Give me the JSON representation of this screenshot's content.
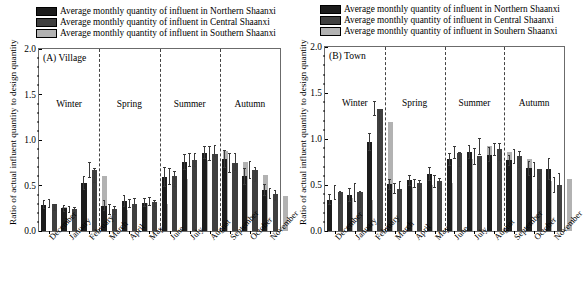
{
  "figure": {
    "panels": [
      {
        "id": "A",
        "label": "(A) Village",
        "ylabel": "Ratio of actual influent quantity to design quantity",
        "legend": [
          "Average monthly quantity of influent in Northern Shaanxi",
          "Average monthly quantity of influent in Central Shaanxi",
          "Average monthly quantity of influent in Southern Shaanxi"
        ]
      },
      {
        "id": "B",
        "label": "(B) Town",
        "ylabel": "Ratio of actual influent quantity to design quantity",
        "legend": [
          "Average monthly quantity of influent in Northern Shaanxi",
          "Average monthly quantity of influent in Central Shaanxi",
          "Average monthly quantity of influent in Souhern Shaanxi"
        ]
      }
    ],
    "colors": {
      "northern": "#1c1c1c",
      "central": "#3f3f3f",
      "southern": "#b2b2b2",
      "frame": "#6b6b6b",
      "error": "#3a3a3a"
    }
  },
  "chart_data": [
    {
      "type": "bar",
      "title": "(A) Village",
      "xlabel": "",
      "ylabel": "Ratio of actual influent quantity to design quantity",
      "ylim": [
        0.0,
        2.0
      ],
      "yticks": [
        "0.0",
        "0.5",
        "1.0",
        "1.5",
        "2.0"
      ],
      "grid": false,
      "legend_position": "top",
      "categories": [
        "December",
        "January",
        "February",
        "March",
        "April",
        "May",
        "June",
        "July",
        "August",
        "September",
        "October",
        "November"
      ],
      "season_labels": [
        "Winter",
        "Spring",
        "Summer",
        "Autumn"
      ],
      "season_breaks": [
        3,
        6,
        9
      ],
      "series": [
        {
          "name": "Average monthly quantity of influent in Northern Shaanxi",
          "color": "#1c1c1c",
          "values": [
            0.29,
            0.25,
            0.53,
            0.28,
            0.33,
            0.31,
            0.59,
            0.76,
            0.86,
            0.79,
            0.6,
            0.45
          ],
          "errors": [
            0.05,
            0.04,
            0.08,
            0.06,
            0.07,
            0.05,
            0.11,
            0.09,
            0.07,
            0.1,
            0.09,
            0.07
          ]
        },
        {
          "name": "Average monthly quantity of influent in Central Shaanxi",
          "color": "#3f3f3f",
          "values": [
            0.3,
            0.24,
            0.67,
            0.24,
            0.3,
            0.32,
            0.6,
            0.78,
            0.85,
            0.75,
            0.67,
            0.41
          ],
          "errors": [
            0.05,
            0.04,
            0.09,
            0.06,
            0.05,
            0.05,
            0.09,
            0.08,
            0.08,
            0.11,
            0.1,
            0.06
          ]
        },
        {
          "name": "Average monthly quantity of influent in Southern Shaanxi",
          "color": "#b2b2b2",
          "values": [
            0.26,
            0.22,
            0.61,
            0.23,
            0.31,
            0.3,
            0.57,
            0.78,
            0.88,
            0.76,
            0.62,
            0.39
          ],
          "errors": [
            0.04,
            0.04,
            0.08,
            0.05,
            0.05,
            0.04,
            0.09,
            0.08,
            0.07,
            0.1,
            0.08,
            0.06
          ]
        }
      ]
    },
    {
      "type": "bar",
      "title": "(B) Town",
      "xlabel": "",
      "ylabel": "Ratio of actual influent quantity to design quantity",
      "ylim": [
        0.0,
        2.0
      ],
      "yticks": [
        "0.0",
        "0.5",
        "1.0",
        "1.5",
        "2.0"
      ],
      "grid": false,
      "legend_position": "top",
      "categories": [
        "December",
        "January",
        "February",
        "March",
        "April",
        "May",
        "June",
        "July",
        "August",
        "September",
        "October",
        "November"
      ],
      "season_labels": [
        "Winter",
        "Spring",
        "Summer",
        "Autumn"
      ],
      "season_breaks": [
        3,
        6,
        9
      ],
      "series": [
        {
          "name": "Average monthly quantity of influent in Northern Shaanxi",
          "color": "#1c1c1c",
          "values": [
            0.34,
            0.39,
            0.97,
            0.51,
            0.55,
            0.62,
            0.78,
            0.86,
            0.83,
            0.77,
            0.68,
            0.67
          ],
          "errors": [
            0.06,
            0.08,
            0.1,
            0.06,
            0.06,
            0.08,
            0.07,
            0.08,
            0.08,
            0.06,
            0.08,
            0.12
          ]
        },
        {
          "name": "Average monthly quantity of influent in Central Shaanxi",
          "color": "#3f3f3f",
          "values": [
            0.42,
            0.42,
            1.33,
            0.46,
            0.52,
            0.54,
            0.85,
            0.81,
            0.89,
            0.81,
            0.67,
            0.5
          ],
          "errors": [
            0.08,
            0.1,
            0.08,
            0.06,
            0.05,
            0.07,
            0.07,
            0.09,
            0.07,
            0.08,
            0.08,
            0.09
          ]
        },
        {
          "name": "Average monthly quantity of influent in Souhern Shaanxi",
          "color": "#b2b2b2",
          "values": [
            0.36,
            0.34,
            1.18,
            0.48,
            0.5,
            0.52,
            0.78,
            0.92,
            0.86,
            0.78,
            0.54,
            0.56
          ],
          "errors": [
            0.07,
            0.09,
            0.12,
            0.06,
            0.05,
            0.06,
            0.08,
            0.09,
            0.1,
            0.09,
            0.09,
            0.07
          ]
        }
      ]
    }
  ]
}
